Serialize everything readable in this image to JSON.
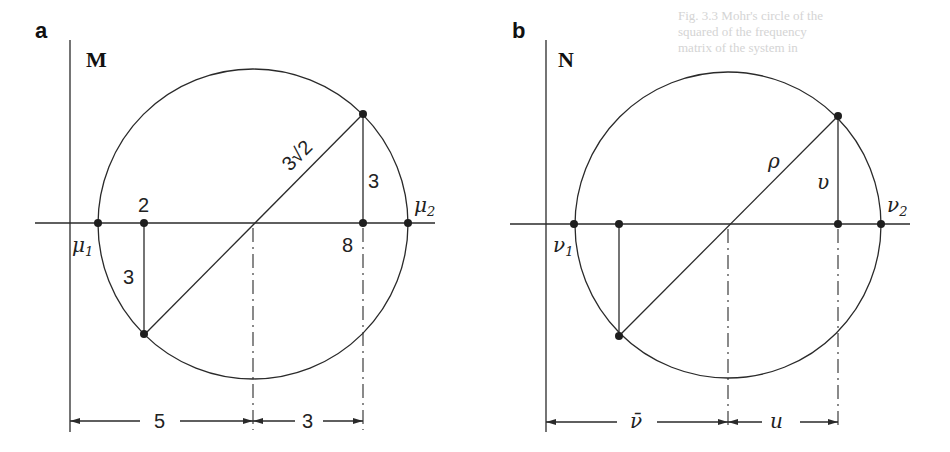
{
  "figure": {
    "background_text": [
      "Fig. 3.3  Mohr's circle of the",
      "squared of the frequency",
      "matrix of the system in"
    ],
    "panels": [
      {
        "id": "a",
        "label": "a",
        "matrix_label": "M",
        "radius_label": "3√2",
        "height_label_right": "3",
        "height_label_left": "3",
        "point_left_label": "2",
        "point_right_label": "8",
        "eig_low_label": "μ",
        "eig_low_sub": "1",
        "eig_high_label": "μ",
        "eig_high_sub": "2",
        "dim_left_label": "5",
        "dim_right_label": "3"
      },
      {
        "id": "b",
        "label": "b",
        "matrix_label": "N",
        "radius_label": "ρ",
        "height_label_right": "υ",
        "eig_low_label": "ν",
        "eig_low_sub": "1",
        "eig_high_label": "ν",
        "eig_high_sub": "2",
        "dim_left_label": "ν̄",
        "dim_right_label": "u"
      }
    ]
  }
}
